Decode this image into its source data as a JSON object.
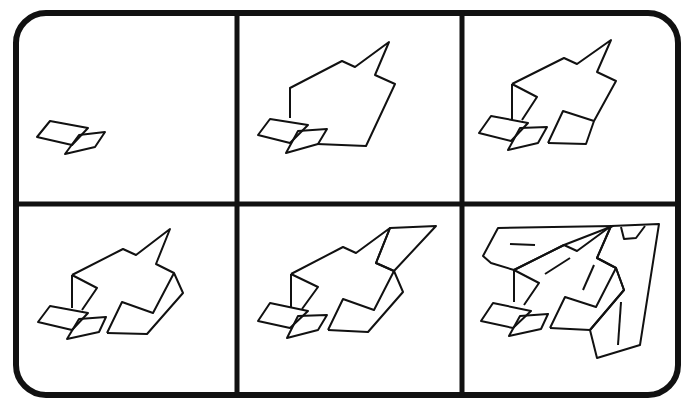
{
  "colors": {
    "ink": "#111111",
    "paper": "#ffffff"
  },
  "frame": {
    "x": 16,
    "y": 13,
    "width": 662,
    "height": 382,
    "radius": 30,
    "stroke": 6
  },
  "dividers": {
    "vertical": [
      237,
      462
    ],
    "horizontal": [
      204
    ],
    "stroke": 5
  },
  "panels": [
    {
      "id": 1,
      "label": "Step 1"
    },
    {
      "id": 2,
      "label": "Step 2"
    },
    {
      "id": 3,
      "label": "Step 3"
    },
    {
      "id": 4,
      "label": "Step 4"
    },
    {
      "id": 5,
      "label": "Step 5"
    },
    {
      "id": 6,
      "label": "Step 6"
    }
  ]
}
